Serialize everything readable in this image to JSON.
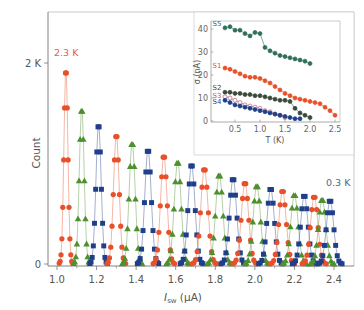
{
  "chart_data": [
    {
      "type": "scatter",
      "title": "",
      "xlabel_main": "I",
      "xlabel_sub": "sw",
      "xlabel_unit": " (µA)",
      "ylabel": "Count",
      "xlim": [
        0.97,
        2.5
      ],
      "ylim": [
        0,
        2500
      ],
      "xticks": [
        1.0,
        1.2,
        1.4,
        1.6,
        1.8,
        2.0,
        2.2,
        2.4
      ],
      "xtick_labels": [
        "1.0",
        "1.2",
        "1.4",
        "1.6",
        "1.8",
        "2.0",
        "2.2",
        "2.4"
      ],
      "yticks": [
        0,
        2000
      ],
      "ytick_labels": [
        "0",
        "2 K"
      ],
      "grid": false,
      "annotations": [
        {
          "text": "2.3 K",
          "x": 1.02,
          "y": 2080,
          "color": "#e8603a"
        },
        {
          "text": "0.3 K",
          "x": 2.38,
          "y": 720,
          "color": "#4a6a8a"
        }
      ],
      "colors": {
        "red": "#e8502a",
        "green": "#4e8f2e",
        "blue": "#1f3f8a"
      },
      "marker_cycle": [
        "circle",
        "triangle",
        "square"
      ],
      "series_note": "Switching-current histograms from 2.3 K (left) to 0.3 K (right); colors cycle red-circle, green-triangle, blue-square",
      "peaks": [
        {
          "center": 1.045,
          "height": 1950,
          "width": 0.01,
          "marker": "circle",
          "color": "red"
        },
        {
          "center": 1.125,
          "height": 1560,
          "width": 0.012,
          "marker": "triangle",
          "color": "green"
        },
        {
          "center": 1.21,
          "height": 1400,
          "width": 0.013,
          "marker": "square",
          "color": "blue"
        },
        {
          "center": 1.3,
          "height": 1300,
          "width": 0.014,
          "marker": "circle",
          "color": "red"
        },
        {
          "center": 1.38,
          "height": 1220,
          "width": 0.015,
          "marker": "triangle",
          "color": "green"
        },
        {
          "center": 1.46,
          "height": 1150,
          "width": 0.016,
          "marker": "square",
          "color": "blue"
        },
        {
          "center": 1.54,
          "height": 1090,
          "width": 0.016,
          "marker": "circle",
          "color": "red"
        },
        {
          "center": 1.61,
          "height": 1030,
          "width": 0.017,
          "marker": "triangle",
          "color": "green"
        },
        {
          "center": 1.68,
          "height": 1000,
          "width": 0.017,
          "marker": "square",
          "color": "blue"
        },
        {
          "center": 1.745,
          "height": 960,
          "width": 0.018,
          "marker": "circle",
          "color": "red"
        },
        {
          "center": 1.82,
          "height": 900,
          "width": 0.018,
          "marker": "triangle",
          "color": "green"
        },
        {
          "center": 1.89,
          "height": 860,
          "width": 0.018,
          "marker": "square",
          "color": "blue"
        },
        {
          "center": 1.95,
          "height": 820,
          "width": 0.018,
          "marker": "circle",
          "color": "red"
        },
        {
          "center": 2.01,
          "height": 790,
          "width": 0.018,
          "marker": "triangle",
          "color": "green"
        },
        {
          "center": 2.08,
          "height": 760,
          "width": 0.018,
          "marker": "square",
          "color": "blue"
        },
        {
          "center": 2.14,
          "height": 740,
          "width": 0.018,
          "marker": "circle",
          "color": "red"
        },
        {
          "center": 2.2,
          "height": 700,
          "width": 0.018,
          "marker": "triangle",
          "color": "green"
        },
        {
          "center": 2.25,
          "height": 690,
          "width": 0.018,
          "marker": "square",
          "color": "blue"
        },
        {
          "center": 2.3,
          "height": 680,
          "width": 0.018,
          "marker": "circle",
          "color": "red"
        },
        {
          "center": 2.34,
          "height": 650,
          "width": 0.018,
          "marker": "triangle",
          "color": "green"
        },
        {
          "center": 2.38,
          "height": 640,
          "width": 0.018,
          "marker": "square",
          "color": "blue"
        }
      ]
    },
    {
      "type": "line",
      "title": "inset",
      "xlabel": "T (K)",
      "ylabel": "σ (nA)",
      "xlim": [
        0,
        2.6
      ],
      "ylim": [
        0,
        45
      ],
      "xticks": [
        0.5,
        1.0,
        1.5,
        2.0,
        2.5
      ],
      "xtick_labels": [
        "0.5",
        "1.0",
        "1.5",
        "2.0",
        "2.5"
      ],
      "yticks": [
        0,
        10,
        20,
        30,
        40
      ],
      "ytick_labels": [
        "0",
        "10",
        "20",
        "30",
        "40"
      ],
      "grid": false,
      "series": [
        {
          "name": "S5",
          "color": "#2e6e5a",
          "filled": true,
          "x": [
            0.3,
            0.4,
            0.5,
            0.6,
            0.7,
            0.8,
            0.9,
            1.0,
            1.1,
            1.2,
            1.3,
            1.4,
            1.5,
            1.6,
            1.7,
            1.8,
            1.9,
            2.0
          ],
          "y": [
            40.5,
            41,
            39.5,
            39.5,
            38,
            37,
            38.5,
            38,
            32,
            30.5,
            29.5,
            28.5,
            28,
            27.5,
            27,
            26.5,
            26,
            25
          ]
        },
        {
          "name": "S1",
          "color": "#e8502a",
          "filled": true,
          "x": [
            0.3,
            0.4,
            0.5,
            0.6,
            0.7,
            0.8,
            0.9,
            1.0,
            1.1,
            1.2,
            1.3,
            1.4,
            1.5,
            1.6,
            1.7,
            1.8,
            1.9,
            2.0,
            2.1,
            2.2,
            2.3,
            2.4,
            2.5
          ],
          "y": [
            23,
            22.5,
            21.5,
            20.5,
            19.5,
            19,
            19,
            18.5,
            17.5,
            16.5,
            15,
            13.5,
            12,
            11,
            10,
            9.5,
            9,
            8.5,
            8,
            7.5,
            6,
            4.5,
            2.5
          ]
        },
        {
          "name": "S2",
          "color": "#3a4a3a",
          "filled": true,
          "x": [
            0.3,
            0.4,
            0.5,
            0.6,
            0.7,
            0.8,
            0.9,
            1.0,
            1.1,
            1.2,
            1.3,
            1.4,
            1.5,
            1.6,
            1.7,
            1.8,
            1.9,
            2.0
          ],
          "y": [
            12.5,
            12.5,
            12,
            12,
            11.5,
            11.5,
            11,
            11,
            10.5,
            10,
            9.5,
            9,
            9,
            8.5,
            5.5,
            3.5,
            2.5,
            1.5
          ]
        },
        {
          "name": "S3",
          "color": "#b0607a",
          "filled": false,
          "x": [
            0.3,
            0.4,
            0.5,
            0.6,
            0.7,
            0.8,
            0.9,
            1.0,
            1.1,
            1.2,
            1.3,
            1.4,
            1.5
          ],
          "y": [
            10.5,
            10,
            9,
            8,
            7,
            6.5,
            6,
            5.5,
            4.5,
            4,
            3,
            2.5,
            1.5
          ]
        },
        {
          "name": "S4",
          "color": "#1f3f8a",
          "filled": true,
          "x": [
            0.3,
            0.4,
            0.5,
            0.6,
            0.7,
            0.8,
            0.9,
            1.0,
            1.1,
            1.2,
            1.3,
            1.4,
            1.5,
            1.6,
            1.7,
            1.8
          ],
          "y": [
            9,
            8,
            7,
            6.5,
            6,
            5.5,
            5,
            4.5,
            4,
            3.5,
            3,
            2.5,
            2,
            1.5,
            1,
            1
          ]
        }
      ]
    }
  ],
  "labels": {
    "ylabel": "Count",
    "xlabel_main": "I",
    "xlabel_sub": "sw",
    "xlabel_unit": " (µA)",
    "annot_high": "2.3 K",
    "annot_low": "0.3 K",
    "inset_xlabel": "T (K)",
    "inset_ylabel": "σ (nA)"
  }
}
